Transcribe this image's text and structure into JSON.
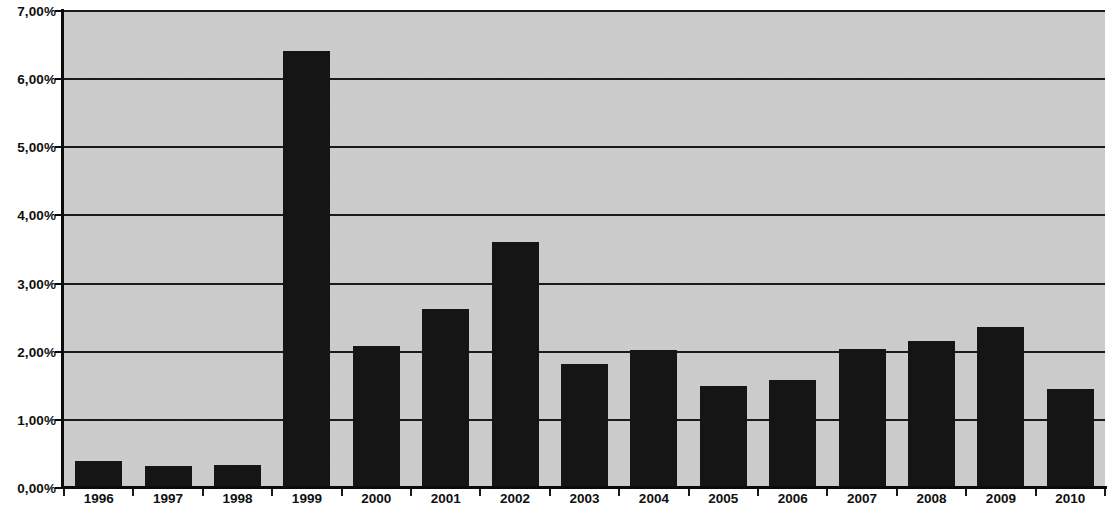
{
  "chart_data": {
    "type": "bar",
    "title": "",
    "subtitle": "",
    "xlabel": "",
    "ylabel": "",
    "categories": [
      "1996",
      "1997",
      "1998",
      "1999",
      "2000",
      "2001",
      "2002",
      "2003",
      "2004",
      "2005",
      "2006",
      "2007",
      "2008",
      "2009",
      "2010"
    ],
    "values": [
      0.4,
      0.32,
      0.34,
      6.42,
      2.08,
      2.63,
      3.61,
      1.82,
      2.03,
      1.5,
      1.59,
      2.04,
      2.15,
      2.37,
      1.45
    ],
    "value_labels": [
      "0,40%",
      "0,32%",
      "0,34%",
      "6,42%",
      "2,08%",
      "2,63%",
      "3,61%",
      "1,82%",
      "2,03%",
      "1,50%",
      "1,59%",
      "2,04%",
      "2,15%",
      "2,37%",
      "1,45%"
    ],
    "ylim": [
      0,
      7
    ],
    "y_ticks": [
      0,
      1,
      2,
      3,
      4,
      5,
      6,
      7
    ],
    "y_tick_labels": [
      "0,00%",
      "1,00%",
      "2,00%",
      "3,00%",
      "4,00%",
      "5,00%",
      "6,00%",
      "7,00%"
    ],
    "grid": "horizontal",
    "legend": "none",
    "series_name": "",
    "bar_color": "#151515",
    "plot_background_color": "#d2d2d2",
    "axis_color": "#0b0b0b",
    "gridline_color": "#1a1a1a",
    "decimal_separator": ","
  }
}
